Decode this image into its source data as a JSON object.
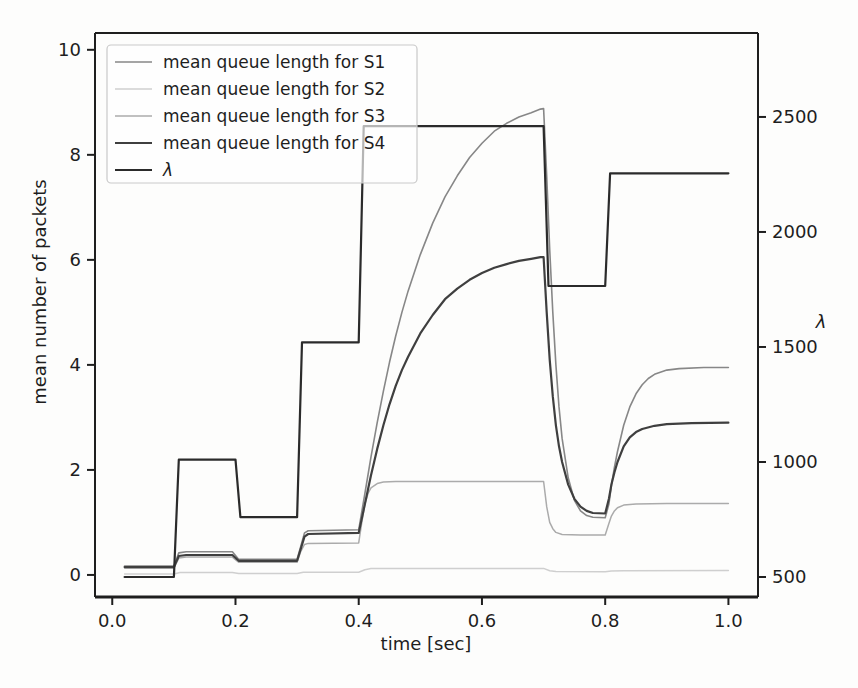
{
  "figure": {
    "background": "#fdfdfc",
    "text_color": "#1e1e1e",
    "spine_color": "#1e1e1e",
    "legend_border_color": "#c9c9c9"
  },
  "chart_data": {
    "type": "line",
    "title": "",
    "xlabel": "time [sec]",
    "ylabel_left": "mean number of packets",
    "ylabel_right": "λ",
    "grid": false,
    "legend_position": "upper left",
    "xlim": [
      -0.028,
      1.048
    ],
    "ylim_left": [
      -0.42,
      10.32
    ],
    "ylim_right": [
      413,
      2865
    ],
    "x_ticks": [
      0.0,
      0.2,
      0.4,
      0.6,
      0.8,
      1.0
    ],
    "x_tick_labels": [
      "0.0",
      "0.2",
      "0.4",
      "0.6",
      "0.8",
      "1.0"
    ],
    "left_ticks": [
      0,
      2,
      4,
      6,
      8,
      10
    ],
    "left_tick_labels": [
      "0",
      "2",
      "4",
      "6",
      "8",
      "10"
    ],
    "right_ticks": [
      500,
      1000,
      1500,
      2000,
      2500
    ],
    "right_tick_labels": [
      "500",
      "1000",
      "1500",
      "2000",
      "2500"
    ],
    "plot_rect_px": {
      "left": 95,
      "top": 33,
      "right": 758,
      "bottom": 597
    },
    "lambda_steps": [
      {
        "t_start": 0.02,
        "t_end": 0.1,
        "value": 500
      },
      {
        "t_start": 0.1,
        "t_end": 0.2,
        "value": 1010
      },
      {
        "t_start": 0.2,
        "t_end": 0.3,
        "value": 760
      },
      {
        "t_start": 0.3,
        "t_end": 0.4,
        "value": 1520
      },
      {
        "t_start": 0.4,
        "t_end": 0.7,
        "value": 2460
      },
      {
        "t_start": 0.7,
        "t_end": 0.8,
        "value": 1765
      },
      {
        "t_start": 0.8,
        "t_end": 1.0,
        "value": 2255
      }
    ],
    "series": [
      {
        "name": "mean queue length for S1",
        "axis": "left",
        "color": "#878787",
        "width": 1.6,
        "italic": false,
        "points": [
          [
            0.02,
            0.17
          ],
          [
            0.1,
            0.17
          ],
          [
            0.108,
            0.42
          ],
          [
            0.12,
            0.44
          ],
          [
            0.195,
            0.44
          ],
          [
            0.205,
            0.3
          ],
          [
            0.3,
            0.3
          ],
          [
            0.306,
            0.55
          ],
          [
            0.312,
            0.8
          ],
          [
            0.318,
            0.84
          ],
          [
            0.4,
            0.86
          ],
          [
            0.41,
            1.55
          ],
          [
            0.42,
            2.25
          ],
          [
            0.43,
            2.9
          ],
          [
            0.44,
            3.5
          ],
          [
            0.45,
            4.05
          ],
          [
            0.46,
            4.55
          ],
          [
            0.47,
            5.0
          ],
          [
            0.48,
            5.4
          ],
          [
            0.5,
            6.1
          ],
          [
            0.52,
            6.7
          ],
          [
            0.54,
            7.2
          ],
          [
            0.56,
            7.6
          ],
          [
            0.58,
            7.95
          ],
          [
            0.6,
            8.22
          ],
          [
            0.62,
            8.45
          ],
          [
            0.64,
            8.6
          ],
          [
            0.66,
            8.72
          ],
          [
            0.68,
            8.8
          ],
          [
            0.695,
            8.87
          ],
          [
            0.7,
            8.88
          ],
          [
            0.705,
            7.6
          ],
          [
            0.71,
            6.2
          ],
          [
            0.715,
            5.0
          ],
          [
            0.72,
            4.0
          ],
          [
            0.725,
            3.2
          ],
          [
            0.73,
            2.6
          ],
          [
            0.74,
            1.85
          ],
          [
            0.75,
            1.42
          ],
          [
            0.76,
            1.22
          ],
          [
            0.77,
            1.13
          ],
          [
            0.78,
            1.1
          ],
          [
            0.8,
            1.09
          ],
          [
            0.806,
            1.35
          ],
          [
            0.81,
            1.7
          ],
          [
            0.815,
            2.05
          ],
          [
            0.82,
            2.35
          ],
          [
            0.83,
            2.85
          ],
          [
            0.84,
            3.2
          ],
          [
            0.85,
            3.45
          ],
          [
            0.86,
            3.62
          ],
          [
            0.87,
            3.74
          ],
          [
            0.88,
            3.82
          ],
          [
            0.9,
            3.9
          ],
          [
            0.92,
            3.93
          ],
          [
            0.96,
            3.95
          ],
          [
            1.0,
            3.95
          ]
        ]
      },
      {
        "name": "mean queue length for S2",
        "axis": "left",
        "color": "#cfcfcf",
        "width": 1.5,
        "italic": false,
        "points": [
          [
            0.02,
            0.02
          ],
          [
            0.1,
            0.02
          ],
          [
            0.11,
            0.045
          ],
          [
            0.195,
            0.045
          ],
          [
            0.205,
            0.03
          ],
          [
            0.3,
            0.03
          ],
          [
            0.31,
            0.05
          ],
          [
            0.4,
            0.05
          ],
          [
            0.41,
            0.1
          ],
          [
            0.42,
            0.12
          ],
          [
            0.7,
            0.125
          ],
          [
            0.71,
            0.08
          ],
          [
            0.72,
            0.065
          ],
          [
            0.8,
            0.06
          ],
          [
            0.81,
            0.075
          ],
          [
            0.83,
            0.08
          ],
          [
            1.0,
            0.085
          ]
        ]
      },
      {
        "name": "mean queue length for S3",
        "axis": "left",
        "color": "#ababab",
        "width": 1.5,
        "italic": false,
        "points": [
          [
            0.02,
            0.13
          ],
          [
            0.1,
            0.13
          ],
          [
            0.108,
            0.32
          ],
          [
            0.12,
            0.34
          ],
          [
            0.195,
            0.34
          ],
          [
            0.205,
            0.24
          ],
          [
            0.3,
            0.24
          ],
          [
            0.306,
            0.45
          ],
          [
            0.312,
            0.58
          ],
          [
            0.318,
            0.6
          ],
          [
            0.4,
            0.61
          ],
          [
            0.405,
            1.0
          ],
          [
            0.41,
            1.35
          ],
          [
            0.415,
            1.55
          ],
          [
            0.42,
            1.66
          ],
          [
            0.43,
            1.74
          ],
          [
            0.44,
            1.77
          ],
          [
            0.46,
            1.78
          ],
          [
            0.7,
            1.78
          ],
          [
            0.705,
            1.3
          ],
          [
            0.71,
            1.0
          ],
          [
            0.715,
            0.88
          ],
          [
            0.72,
            0.81
          ],
          [
            0.73,
            0.77
          ],
          [
            0.76,
            0.76
          ],
          [
            0.8,
            0.76
          ],
          [
            0.806,
            0.98
          ],
          [
            0.81,
            1.12
          ],
          [
            0.815,
            1.22
          ],
          [
            0.82,
            1.28
          ],
          [
            0.83,
            1.33
          ],
          [
            0.85,
            1.35
          ],
          [
            0.9,
            1.36
          ],
          [
            1.0,
            1.36
          ]
        ]
      },
      {
        "name": "mean queue length for S4",
        "axis": "left",
        "color": "#3f3f3f",
        "width": 2.2,
        "italic": false,
        "points": [
          [
            0.02,
            0.15
          ],
          [
            0.1,
            0.15
          ],
          [
            0.108,
            0.36
          ],
          [
            0.12,
            0.38
          ],
          [
            0.195,
            0.38
          ],
          [
            0.205,
            0.27
          ],
          [
            0.3,
            0.27
          ],
          [
            0.306,
            0.5
          ],
          [
            0.312,
            0.73
          ],
          [
            0.318,
            0.78
          ],
          [
            0.4,
            0.8
          ],
          [
            0.41,
            1.35
          ],
          [
            0.42,
            1.9
          ],
          [
            0.43,
            2.4
          ],
          [
            0.44,
            2.85
          ],
          [
            0.45,
            3.25
          ],
          [
            0.46,
            3.6
          ],
          [
            0.47,
            3.9
          ],
          [
            0.48,
            4.15
          ],
          [
            0.5,
            4.6
          ],
          [
            0.52,
            4.95
          ],
          [
            0.54,
            5.25
          ],
          [
            0.56,
            5.45
          ],
          [
            0.58,
            5.62
          ],
          [
            0.6,
            5.75
          ],
          [
            0.62,
            5.85
          ],
          [
            0.64,
            5.92
          ],
          [
            0.66,
            5.98
          ],
          [
            0.68,
            6.02
          ],
          [
            0.695,
            6.05
          ],
          [
            0.7,
            6.05
          ],
          [
            0.705,
            5.0
          ],
          [
            0.71,
            4.1
          ],
          [
            0.715,
            3.4
          ],
          [
            0.72,
            2.85
          ],
          [
            0.725,
            2.45
          ],
          [
            0.73,
            2.15
          ],
          [
            0.74,
            1.72
          ],
          [
            0.75,
            1.45
          ],
          [
            0.76,
            1.3
          ],
          [
            0.77,
            1.22
          ],
          [
            0.78,
            1.18
          ],
          [
            0.8,
            1.17
          ],
          [
            0.806,
            1.45
          ],
          [
            0.81,
            1.72
          ],
          [
            0.815,
            1.95
          ],
          [
            0.82,
            2.15
          ],
          [
            0.83,
            2.45
          ],
          [
            0.84,
            2.62
          ],
          [
            0.85,
            2.72
          ],
          [
            0.86,
            2.78
          ],
          [
            0.88,
            2.84
          ],
          [
            0.9,
            2.87
          ],
          [
            0.94,
            2.89
          ],
          [
            1.0,
            2.9
          ]
        ]
      },
      {
        "name": "λ",
        "axis": "right",
        "color": "#2b2b2b",
        "width": 2.2,
        "italic": true,
        "points": [
          [
            0.02,
            500
          ],
          [
            0.1,
            500
          ],
          [
            0.108,
            1010
          ],
          [
            0.2,
            1010
          ],
          [
            0.208,
            760
          ],
          [
            0.3,
            760
          ],
          [
            0.308,
            1520
          ],
          [
            0.4,
            1520
          ],
          [
            0.408,
            2460
          ],
          [
            0.7,
            2460
          ],
          [
            0.708,
            1765
          ],
          [
            0.8,
            1765
          ],
          [
            0.808,
            2255
          ],
          [
            1.0,
            2255
          ]
        ]
      }
    ]
  }
}
